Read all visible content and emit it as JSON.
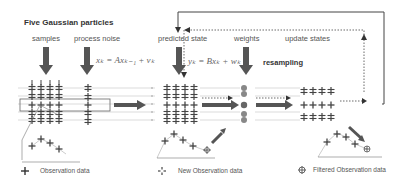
{
  "diagram": {
    "title": "Five Gaussian particles",
    "labels": {
      "samples": "samples",
      "process_noise": "process noise",
      "predicted_state": "predicted state",
      "weights": "weights",
      "update_states": "update states",
      "resampling": "resampling"
    },
    "equations": {
      "process": "x_k = Ax_{k-1} + v_k",
      "process_display": "xₖ = Axₖ₋₁ + vₖ",
      "measurement": "y_k = Bx_k + w_k",
      "measurement_display": "yₖ = Bxₖ + wₖ"
    },
    "legend": [
      {
        "icon": "plus-marker-icon",
        "label": "Observation data"
      },
      {
        "icon": "diamond-cross-marker-icon",
        "label": "New Observation data"
      },
      {
        "icon": "circle-cross-marker-icon",
        "label": "Filtered Observation data"
      }
    ],
    "colors": {
      "arrow": "#555555",
      "marker": "#444444",
      "grid_line": "#bbbbbb",
      "weight_dot": "#777777",
      "text": "#555555"
    }
  }
}
